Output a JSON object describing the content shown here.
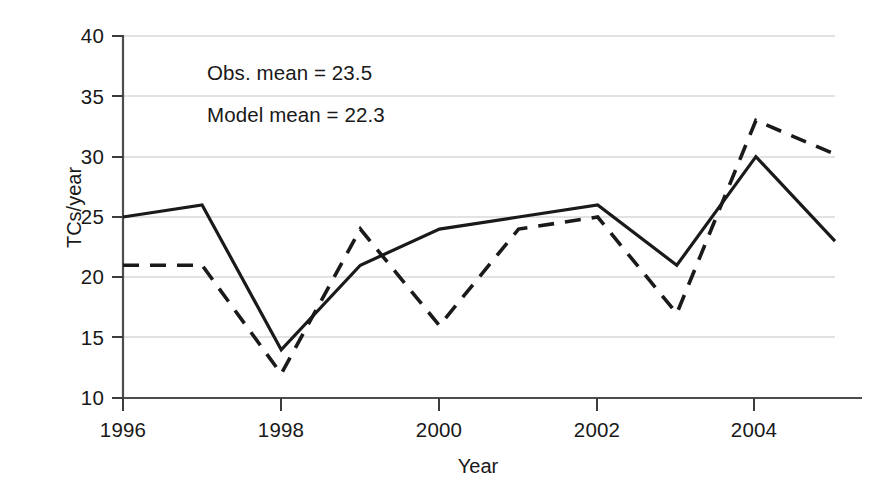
{
  "chart_data": {
    "type": "line",
    "title": "",
    "xlabel": "Year",
    "ylabel": "TCs/year",
    "x": [
      1996,
      1997,
      1998,
      1999,
      2000,
      2001,
      2002,
      2003,
      2004,
      2005
    ],
    "xlim": [
      1996,
      2005
    ],
    "ylim": [
      10,
      40
    ],
    "xticks": [
      1996,
      1998,
      2000,
      2002,
      2004
    ],
    "xtick_labels": [
      "1996",
      "1998",
      "2000",
      "2002",
      "2004"
    ],
    "yticks": [
      10,
      15,
      20,
      25,
      30,
      35,
      40
    ],
    "ytick_labels": [
      "10",
      "15",
      "20",
      "25",
      "30",
      "35",
      "40"
    ],
    "grid": "horizontal",
    "legend_position": "none",
    "series": [
      {
        "name": "Observed",
        "style": "solid",
        "color": "#1a1a1a",
        "values": [
          25,
          26,
          14,
          21,
          24,
          25,
          26,
          21,
          30,
          23
        ]
      },
      {
        "name": "Model",
        "style": "dashed",
        "color": "#1a1a1a",
        "values": [
          21,
          21,
          12,
          24,
          16,
          24,
          25,
          17,
          33,
          30.2
        ]
      }
    ],
    "annotations": [
      {
        "id": "obs_mean",
        "text": "Obs. mean = 23.5",
        "value": 23.5
      },
      {
        "id": "model_mean",
        "text": "Model mean = 22.3",
        "value": 22.3
      }
    ]
  },
  "axis": {
    "ylabel_text": "TCs/year",
    "xlabel_text": "Year",
    "ytick_0": "10",
    "ytick_1": "15",
    "ytick_2": "20",
    "ytick_3": "25",
    "ytick_4": "30",
    "ytick_5": "35",
    "ytick_6": "40",
    "xtick_0": "1996",
    "xtick_1": "1998",
    "xtick_2": "2000",
    "xtick_3": "2002",
    "xtick_4": "2004"
  },
  "annotations": {
    "obs_mean_text": "Obs. mean = 23.5",
    "model_mean_text": "Model mean = 22.3"
  },
  "colors": {
    "line": "#1a1a1a",
    "grid": "#d5d5d5",
    "axis": "#4d4d4d",
    "background": "#ffffff"
  }
}
